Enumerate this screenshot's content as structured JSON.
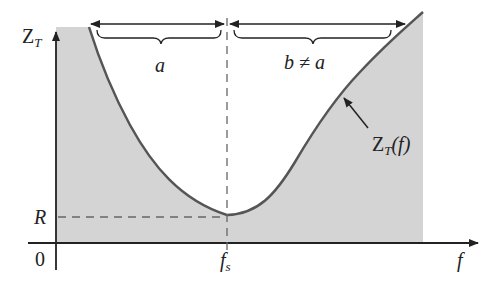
{
  "diagram": {
    "title": "",
    "y_axis": {
      "label_main": "Z",
      "label_sub": "T"
    },
    "x_axis": {
      "label": "f",
      "origin_label": "0"
    },
    "resonance": {
      "x_label_main": "f",
      "x_label_sub": "s",
      "y_label": "R"
    },
    "bandwidth_left": {
      "label": "a"
    },
    "bandwidth_right": {
      "label": "b ≠ a"
    },
    "curve_label": {
      "main": "Z",
      "sub": "T",
      "suffix": "(f)"
    },
    "colors": {
      "shade": "#d4d4d4",
      "curve": "#555555",
      "axis": "#222222",
      "dashed": "#666666"
    }
  }
}
